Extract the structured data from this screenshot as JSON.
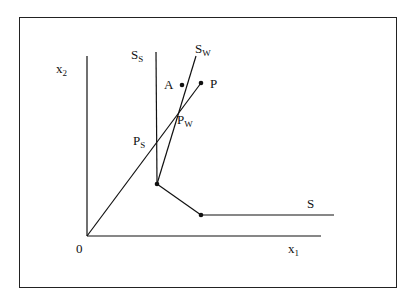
{
  "diagram": {
    "axes": {
      "x_label": "x",
      "x_sub": "1",
      "y_label": "x",
      "y_sub": "2",
      "origin_label": "0"
    },
    "curves": {
      "s_label": "S",
      "ss_label": "S",
      "ss_sub": "S",
      "sw_label": "S",
      "sw_sub": "W"
    },
    "points": {
      "a_label": "A",
      "p_label": "P",
      "pw_label": "P",
      "pw_sub": "W",
      "ps_label": "P",
      "ps_sub": "S"
    },
    "colors": {
      "line": "#111111",
      "background": "#ffffff"
    }
  }
}
